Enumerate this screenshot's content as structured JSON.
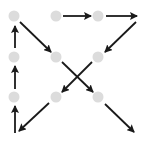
{
  "diagram": {
    "title": "",
    "dot_color": "#dcdcdc",
    "arrow_color": "#1a1a1a",
    "dot_radius": 5.5,
    "dots": [
      {
        "id": "r1c1",
        "x": 14,
        "y": 16
      },
      {
        "id": "r1c2",
        "x": 56,
        "y": 16
      },
      {
        "id": "r1c3",
        "x": 98,
        "y": 16
      },
      {
        "id": "r2c1",
        "x": 14,
        "y": 57
      },
      {
        "id": "r2c2",
        "x": 56,
        "y": 57
      },
      {
        "id": "r2c3",
        "x": 98,
        "y": 57
      },
      {
        "id": "r3c1",
        "x": 14,
        "y": 97
      },
      {
        "id": "r3c2",
        "x": 56,
        "y": 97
      },
      {
        "id": "r3c3",
        "x": 98,
        "y": 97
      }
    ],
    "arrows": [
      {
        "x1": 15,
        "y1": 133,
        "x2": 15,
        "y2": 106
      },
      {
        "x1": 15,
        "y1": 89,
        "x2": 15,
        "y2": 66
      },
      {
        "x1": 15,
        "y1": 48,
        "x2": 15,
        "y2": 26
      },
      {
        "x1": 20,
        "y1": 22,
        "x2": 51,
        "y2": 52
      },
      {
        "x1": 62,
        "y1": 62,
        "x2": 93,
        "y2": 92
      },
      {
        "x1": 105,
        "y1": 104,
        "x2": 134,
        "y2": 132
      },
      {
        "x1": 63,
        "y1": 16,
        "x2": 91,
        "y2": 16
      },
      {
        "x1": 106,
        "y1": 16,
        "x2": 137,
        "y2": 16
      },
      {
        "x1": 136,
        "y1": 22,
        "x2": 105,
        "y2": 52
      },
      {
        "x1": 92,
        "y1": 62,
        "x2": 62,
        "y2": 92
      },
      {
        "x1": 49,
        "y1": 103,
        "x2": 19,
        "y2": 131
      }
    ]
  }
}
